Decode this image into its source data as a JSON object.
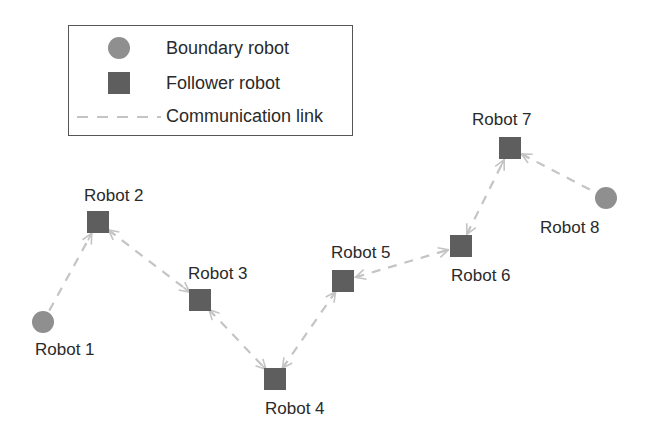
{
  "legend": {
    "items": [
      {
        "label": "Boundary robot",
        "symbol": "circle",
        "color": "#8f8f8f"
      },
      {
        "label": "Follower robot",
        "symbol": "square",
        "color": "#5e5e5e"
      },
      {
        "label": "Communication link",
        "symbol": "dashed-line",
        "color": "#c4c4c4"
      }
    ]
  },
  "colors": {
    "boundary": "#8f8f8f",
    "follower": "#5e5e5e",
    "link": "#c4c4c4",
    "text": "#2a2a2a"
  },
  "robots": [
    {
      "id": 1,
      "label": "Robot 1",
      "type": "boundary",
      "x": 43,
      "y": 322
    },
    {
      "id": 2,
      "label": "Robot 2",
      "type": "follower",
      "x": 98,
      "y": 222
    },
    {
      "id": 3,
      "label": "Robot 3",
      "type": "follower",
      "x": 200,
      "y": 300
    },
    {
      "id": 4,
      "label": "Robot 4",
      "type": "follower",
      "x": 275,
      "y": 379
    },
    {
      "id": 5,
      "label": "Robot 5",
      "type": "follower",
      "x": 343,
      "y": 281
    },
    {
      "id": 6,
      "label": "Robot 6",
      "type": "follower",
      "x": 461,
      "y": 246
    },
    {
      "id": 7,
      "label": "Robot 7",
      "type": "follower",
      "x": 510,
      "y": 148
    },
    {
      "id": 8,
      "label": "Robot 8",
      "type": "boundary",
      "x": 606,
      "y": 198
    }
  ],
  "links": [
    {
      "from": 1,
      "to": 2,
      "arrow_from": false,
      "arrow_to": true
    },
    {
      "from": 2,
      "to": 3,
      "arrow_from": true,
      "arrow_to": true
    },
    {
      "from": 3,
      "to": 4,
      "arrow_from": true,
      "arrow_to": true
    },
    {
      "from": 4,
      "to": 5,
      "arrow_from": true,
      "arrow_to": true
    },
    {
      "from": 5,
      "to": 6,
      "arrow_from": true,
      "arrow_to": true
    },
    {
      "from": 6,
      "to": 7,
      "arrow_from": true,
      "arrow_to": true
    },
    {
      "from": 7,
      "to": 8,
      "arrow_from": true,
      "arrow_to": false
    }
  ]
}
